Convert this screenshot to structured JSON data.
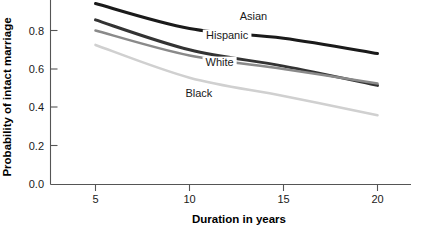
{
  "chart_data": {
    "type": "line",
    "title": "",
    "subtitle": "",
    "xlabel": "Duration in years",
    "ylabel": "Probability of intact marriage",
    "x": [
      5,
      10,
      15,
      20
    ],
    "xlim": [
      3.2,
      21.5
    ],
    "ylim": [
      0.0,
      0.96
    ],
    "xticks": [
      5,
      10,
      15,
      20
    ],
    "xtick_labels": [
      "5",
      "10",
      "15",
      "20"
    ],
    "yticks": [
      0.0,
      0.2,
      0.4,
      0.6,
      0.8
    ],
    "ytick_labels": [
      "0.0",
      "0.2",
      "0.4",
      "0.6",
      "0.8"
    ],
    "grid": false,
    "legend_position": "inline-annotations",
    "series": [
      {
        "name": "Asian",
        "color": "#1a1a1a",
        "values": [
          0.94,
          0.81,
          0.76,
          0.68
        ],
        "label_x": 13.4,
        "label_y": 0.855
      },
      {
        "name": "Hispanic",
        "color": "#333333",
        "values": [
          0.855,
          0.7,
          0.615,
          0.515
        ],
        "label_x": 12.0,
        "label_y": 0.755
      },
      {
        "name": "White",
        "color": "#8a8a8a",
        "values": [
          0.8,
          0.67,
          0.6,
          0.525
        ],
        "label_x": 11.6,
        "label_y": 0.615
      },
      {
        "name": "Black",
        "color": "#d0d0d0",
        "values": [
          0.725,
          0.555,
          0.46,
          0.36
        ],
        "label_x": 10.5,
        "label_y": 0.455
      }
    ]
  },
  "axes": {
    "y_title": "Probability of intact marriage",
    "x_title": "Duration in years",
    "y_ticks": [
      {
        "label": "0.8"
      },
      {
        "label": "0.6"
      },
      {
        "label": "0.4"
      },
      {
        "label": "0.2"
      },
      {
        "label": "0.0"
      }
    ],
    "x_ticks": [
      {
        "label": "5"
      },
      {
        "label": "10"
      },
      {
        "label": "15"
      },
      {
        "label": "20"
      }
    ]
  },
  "annotations": {
    "asian": "Asian",
    "hispanic": "Hispanic",
    "white": "White",
    "black": "Black"
  }
}
